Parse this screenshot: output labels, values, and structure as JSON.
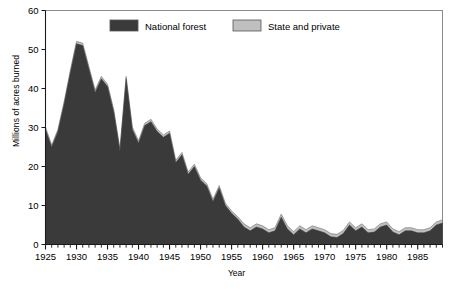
{
  "chart_data": {
    "type": "area",
    "stacked": true,
    "title": "",
    "xlabel": "Year",
    "ylabel": "Millions of acres burned",
    "xlim": [
      1925,
      1989
    ],
    "ylim": [
      0,
      60
    ],
    "yticks": [
      0,
      10,
      20,
      30,
      40,
      50,
      60
    ],
    "xticks": [
      1925,
      1930,
      1935,
      1940,
      1945,
      1950,
      1955,
      1960,
      1965,
      1970,
      1975,
      1980,
      1985
    ],
    "xtick_labels": [
      "1925",
      "1930",
      "1935",
      "1940",
      "1945",
      "1950",
      "1955",
      "1960",
      "1965",
      "1970",
      "1975",
      "1980",
      "1985"
    ],
    "ytick_labels": [
      "0",
      "10",
      "20",
      "30",
      "40",
      "50",
      "60"
    ],
    "minor_xticks_every": 1,
    "grid": false,
    "legend_position": "top-center",
    "x": [
      1925,
      1926,
      1927,
      1928,
      1929,
      1930,
      1931,
      1932,
      1933,
      1934,
      1935,
      1936,
      1937,
      1938,
      1939,
      1940,
      1941,
      1942,
      1943,
      1944,
      1945,
      1946,
      1947,
      1948,
      1949,
      1950,
      1951,
      1952,
      1953,
      1954,
      1955,
      1956,
      1957,
      1958,
      1959,
      1960,
      1961,
      1962,
      1963,
      1964,
      1965,
      1966,
      1967,
      1968,
      1969,
      1970,
      1971,
      1972,
      1973,
      1974,
      1975,
      1976,
      1977,
      1978,
      1979,
      1980,
      1981,
      1982,
      1983,
      1984,
      1985,
      1986,
      1987,
      1988,
      1989
    ],
    "series": [
      {
        "name": "National forest",
        "color": "#3a3a3a",
        "values": [
          29.5,
          25.0,
          29.0,
          36.0,
          44.0,
          51.5,
          51.0,
          45.0,
          39.0,
          42.5,
          40.5,
          34.0,
          24.0,
          42.5,
          29.5,
          26.0,
          30.5,
          31.5,
          29.0,
          27.5,
          28.5,
          21.0,
          23.0,
          18.0,
          20.0,
          16.5,
          15.0,
          11.0,
          14.5,
          10.0,
          8.0,
          6.5,
          4.5,
          3.5,
          4.5,
          4.0,
          3.0,
          3.5,
          7.0,
          4.0,
          2.5,
          4.0,
          3.0,
          4.0,
          3.5,
          3.0,
          2.0,
          1.8,
          2.8,
          5.0,
          3.5,
          4.5,
          3.0,
          3.2,
          4.5,
          5.0,
          3.2,
          2.5,
          3.5,
          3.5,
          3.0,
          3.0,
          3.5,
          5.0,
          5.5
        ]
      },
      {
        "name": "State and private",
        "color": "#bfbfbf",
        "values": [
          0.6,
          0.5,
          0.5,
          0.6,
          0.6,
          0.6,
          0.6,
          0.6,
          0.6,
          0.6,
          0.6,
          0.6,
          0.6,
          0.6,
          0.6,
          0.6,
          0.6,
          0.6,
          0.6,
          0.6,
          0.6,
          0.6,
          0.6,
          0.6,
          0.6,
          0.6,
          0.6,
          0.6,
          0.6,
          0.6,
          0.6,
          0.6,
          0.8,
          0.8,
          0.8,
          0.8,
          0.8,
          0.8,
          0.8,
          0.8,
          0.8,
          0.8,
          0.8,
          0.8,
          0.8,
          0.8,
          0.8,
          0.8,
          0.8,
          0.8,
          0.8,
          0.8,
          0.8,
          0.8,
          0.8,
          0.8,
          0.8,
          0.8,
          0.8,
          0.8,
          0.8,
          0.8,
          0.8,
          0.8,
          0.8
        ]
      }
    ]
  },
  "legend": {
    "items": [
      {
        "label": "National forest",
        "color": "#3a3a3a"
      },
      {
        "label": "State and private",
        "color": "#bfbfbf"
      }
    ]
  },
  "axes": {
    "xlabel": "Year",
    "ylabel": "Millions of acres burned"
  },
  "colors": {
    "national_forest": "#3a3a3a",
    "state_private": "#bfbfbf",
    "frame": "#8a8a8a",
    "axis": "#1a1a1a"
  }
}
